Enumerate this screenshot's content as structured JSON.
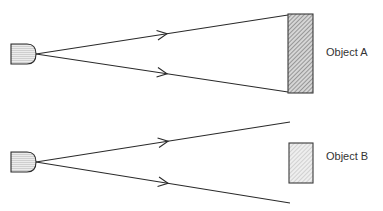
{
  "diagram": {
    "title": "",
    "colors": {
      "line": "#2a2a2a",
      "emitter_fill": "#e4e4e4",
      "object_a_fill": "#b8b8b8",
      "object_b_fill": "#dcdcdc",
      "text": "#333333"
    },
    "scenes": [
      {
        "id": "scene-a",
        "emitter": {
          "x": 11,
          "y": 44,
          "w": 16,
          "h": 20,
          "apex_x": 36
        },
        "rays": [
          {
            "from": [
              36,
              54
            ],
            "to": [
              288,
              15
            ],
            "arrow_at": 0.52
          },
          {
            "from": [
              36,
              54
            ],
            "to": [
              288,
              92
            ],
            "arrow_at": 0.52
          }
        ],
        "object": {
          "label": "Object A",
          "x": 288,
          "y": 14,
          "w": 25,
          "h": 79
        },
        "label_pos": {
          "x": 326,
          "y": 46
        }
      },
      {
        "id": "scene-b",
        "emitter": {
          "x": 11,
          "y": 152,
          "w": 16,
          "h": 20,
          "apex_x": 36
        },
        "rays": [
          {
            "from": [
              36,
              162
            ],
            "to": [
              290,
              122
            ],
            "arrow_at": 0.52
          },
          {
            "from": [
              36,
              162
            ],
            "to": [
              290,
              203
            ],
            "arrow_at": 0.52
          }
        ],
        "object": {
          "label": "Object B",
          "x": 289,
          "y": 143,
          "w": 24,
          "h": 40
        },
        "label_pos": {
          "x": 326,
          "y": 150
        }
      }
    ]
  }
}
